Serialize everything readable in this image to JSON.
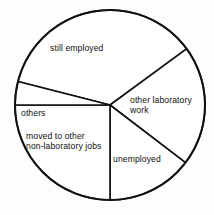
{
  "chart_data": {
    "type": "pie",
    "title": "",
    "subtitle": "",
    "xlabel": "",
    "ylabel": "",
    "legend": "none",
    "grid": false,
    "labels_inside": true,
    "categories": [
      "still employed",
      "other laboratory work",
      "unemployed",
      "moved to other\nnon-laboratory jobs",
      "others"
    ],
    "values": [
      130,
      73.7,
      52.6,
      90,
      14.3
    ],
    "value_unit": "degrees",
    "percentages": [
      36.1,
      20.5,
      14.6,
      25.0,
      4.0
    ],
    "slices": [
      {
        "label": "still employed",
        "start_angle_deg": 194.3,
        "end_angle_deg": 323.7,
        "sweep_deg": 130.0,
        "percent": 36.1,
        "fill": "#ffffff",
        "stroke": "#111111"
      },
      {
        "label": "other laboratory work",
        "start_angle_deg": 323.7,
        "end_angle_deg": 37.4,
        "sweep_deg": 73.7,
        "percent": 20.5,
        "fill": "#ffffff",
        "stroke": "#111111"
      },
      {
        "label": "unemployed",
        "start_angle_deg": 37.4,
        "end_angle_deg": 90.0,
        "sweep_deg": 52.6,
        "percent": 14.6,
        "fill": "#ffffff",
        "stroke": "#111111"
      },
      {
        "label": "moved to other non-laboratory jobs",
        "start_angle_deg": 90.0,
        "end_angle_deg": 180.0,
        "sweep_deg": 90.0,
        "percent": 25.0,
        "fill": "#ffffff",
        "stroke": "#111111"
      },
      {
        "label": "others",
        "start_angle_deg": 180.0,
        "end_angle_deg": 194.3,
        "sweep_deg": 14.3,
        "percent": 4.0,
        "fill": "#ffffff",
        "stroke": "#111111"
      }
    ],
    "geometry": {
      "center_x": 110,
      "center_y": 105,
      "radius": 95
    }
  },
  "labels": {
    "still_employed": "still employed",
    "other_laboratory_work_line1": "other laboratory",
    "other_laboratory_work_line2": "work",
    "unemployed": "unemployed",
    "others": "others",
    "moved_line1": "moved to other",
    "moved_line2": "non-laboratory jobs"
  },
  "colors": {
    "stroke": "#111111",
    "fill": "#ffffff",
    "background": "#fdfdfd",
    "text": "#101010"
  }
}
